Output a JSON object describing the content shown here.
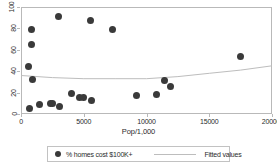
{
  "chart_data": {
    "type": "scatter",
    "title": "",
    "xlabel": "Pop/1,000",
    "ylabel": "",
    "xlim": [
      0,
      20000
    ],
    "ylim": [
      0,
      100
    ],
    "xticks": [
      "0",
      "5000",
      "10000",
      "15000",
      "20000"
    ],
    "xtick_values": [
      0,
      5000,
      10000,
      15000,
      20000
    ],
    "yticks": [
      "0",
      "20",
      "40",
      "60",
      "80",
      "100"
    ],
    "ytick_values": [
      0,
      20,
      40,
      60,
      80,
      100
    ],
    "grid": false,
    "legend_position": "below",
    "series": [
      {
        "name": "% homes cost $100K+",
        "type": "scatter",
        "marker": "filled-circle",
        "color": "#3a3a3a",
        "points": [
          {
            "x": 600,
            "y": 44
          },
          {
            "x": 700,
            "y": 5
          },
          {
            "x": 800,
            "y": 79
          },
          {
            "x": 850,
            "y": 65
          },
          {
            "x": 950,
            "y": 32
          },
          {
            "x": 1500,
            "y": 9
          },
          {
            "x": 2350,
            "y": 10
          },
          {
            "x": 2500,
            "y": 10
          },
          {
            "x": 3000,
            "y": 91
          },
          {
            "x": 3050,
            "y": 7
          },
          {
            "x": 4050,
            "y": 19
          },
          {
            "x": 4700,
            "y": 15
          },
          {
            "x": 4950,
            "y": 15
          },
          {
            "x": 5550,
            "y": 87
          },
          {
            "x": 5600,
            "y": 13
          },
          {
            "x": 7300,
            "y": 79
          },
          {
            "x": 9200,
            "y": 17
          },
          {
            "x": 10800,
            "y": 18
          },
          {
            "x": 11400,
            "y": 31
          },
          {
            "x": 11900,
            "y": 26
          },
          {
            "x": 17500,
            "y": 54
          }
        ]
      },
      {
        "name": "Fitted values",
        "type": "line",
        "color": "#bdbdbd",
        "points": [
          {
            "x": 0,
            "y": 36
          },
          {
            "x": 2500,
            "y": 34
          },
          {
            "x": 5000,
            "y": 33
          },
          {
            "x": 7500,
            "y": 33
          },
          {
            "x": 10000,
            "y": 33
          },
          {
            "x": 12500,
            "y": 35
          },
          {
            "x": 15000,
            "y": 38
          },
          {
            "x": 17500,
            "y": 41
          },
          {
            "x": 20000,
            "y": 45
          }
        ]
      }
    ],
    "legend": [
      {
        "label": "% homes cost $100K+",
        "marker": "filled-circle"
      },
      {
        "label": "Fitted values",
        "marker": "line"
      }
    ]
  }
}
